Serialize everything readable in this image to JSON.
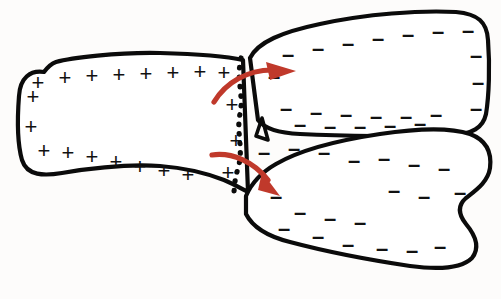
{
  "figure": {
    "background_color": "#fdfcfb",
    "outline_color": "#0b0b0b",
    "arrow_color": "#c0392b",
    "caption": ""
  },
  "cells": [
    {
      "id": "left-cell",
      "name": "positively-charged-cell",
      "charge_symbol": "+",
      "charge_sign": "positive",
      "charge_count": 20,
      "outline_path": "M 44 72 C 30 70 20 78 19 96 C 17 122 18 146 22 160 C 27 176 44 176 62 173 C 92 168 130 164 160 166 C 186 168 206 173 224 180 C 236 185 244 190 248 192 L 243 60 C 230 57 200 54 160 53 C 118 52 70 58 56 62 C 50 64 47 68 44 72 Z"
    },
    {
      "id": "top-right-cell",
      "name": "negatively-charged-cell-upper",
      "charge_symbol": "–",
      "charge_sign": "negative",
      "charge_count": 22,
      "outline_path": "M 250 58 C 258 42 282 32 320 24 C 366 14 420 10 456 12 C 478 14 487 22 488 40 C 490 66 489 96 486 114 C 483 128 472 134 452 135 C 410 137 340 136 300 134 C 278 133 264 128 258 120 L 250 58 Z"
    },
    {
      "id": "bottom-right-cell",
      "name": "negatively-charged-cell-lower",
      "charge_symbol": "–",
      "charge_sign": "negative",
      "charge_count": 20,
      "outline_path": "M 246 196 C 252 182 262 172 276 164 C 300 150 340 140 380 134 C 420 128 452 128 470 134 C 486 140 492 152 490 168 C 488 182 476 190 466 198 C 458 205 458 214 466 224 C 476 236 480 248 472 258 C 462 268 440 270 410 266 C 370 260 320 250 290 242 C 266 236 252 226 246 214 Z"
    }
  ],
  "junction": {
    "name": "membrane-junction",
    "style": "dotted",
    "path": "M 241 58 C 236 80 244 96 240 114 C 236 132 244 150 238 168 C 234 182 234 190 234 198"
  },
  "wedge": {
    "name": "cell-contact-wedge",
    "path": "M 262 118 L 268 140 L 256 136 Z"
  },
  "arrows": [
    {
      "id": "arrow-upper",
      "name": "transport-arrow-upper",
      "direction": "right-up",
      "color": "#c0392b",
      "body_path": "M 214 102 C 226 82 248 70 272 70",
      "head_points": "296 71 266 62 270 80"
    },
    {
      "id": "arrow-lower",
      "name": "transport-arrow-lower",
      "direction": "right-down",
      "color": "#c0392b",
      "body_path": "M 212 155 C 232 152 254 162 268 180",
      "head_points": "280 196 262 172 258 190"
    }
  ],
  "charge_marks": {
    "positive": [
      {
        "x": 33,
        "y": 96
      },
      {
        "x": 31,
        "y": 126
      },
      {
        "x": 38,
        "y": 82
      },
      {
        "x": 65,
        "y": 77
      },
      {
        "x": 92,
        "y": 75
      },
      {
        "x": 119,
        "y": 74
      },
      {
        "x": 146,
        "y": 73
      },
      {
        "x": 173,
        "y": 72
      },
      {
        "x": 200,
        "y": 71
      },
      {
        "x": 224,
        "y": 72
      },
      {
        "x": 232,
        "y": 104
      },
      {
        "x": 236,
        "y": 140
      },
      {
        "x": 228,
        "y": 172
      },
      {
        "x": 44,
        "y": 150
      },
      {
        "x": 68,
        "y": 152
      },
      {
        "x": 92,
        "y": 156
      },
      {
        "x": 116,
        "y": 161
      },
      {
        "x": 140,
        "y": 166
      },
      {
        "x": 164,
        "y": 170
      },
      {
        "x": 188,
        "y": 174
      }
    ],
    "negative_upper": [
      {
        "x": 288,
        "y": 54
      },
      {
        "x": 318,
        "y": 48
      },
      {
        "x": 348,
        "y": 43
      },
      {
        "x": 378,
        "y": 38
      },
      {
        "x": 408,
        "y": 34
      },
      {
        "x": 438,
        "y": 31
      },
      {
        "x": 468,
        "y": 30
      },
      {
        "x": 476,
        "y": 55
      },
      {
        "x": 478,
        "y": 82
      },
      {
        "x": 476,
        "y": 108
      },
      {
        "x": 274,
        "y": 76
      },
      {
        "x": 286,
        "y": 108
      },
      {
        "x": 316,
        "y": 112
      },
      {
        "x": 346,
        "y": 114
      },
      {
        "x": 376,
        "y": 116
      },
      {
        "x": 406,
        "y": 116
      },
      {
        "x": 436,
        "y": 114
      },
      {
        "x": 300,
        "y": 124
      },
      {
        "x": 330,
        "y": 126
      },
      {
        "x": 360,
        "y": 126
      },
      {
        "x": 390,
        "y": 125
      },
      {
        "x": 420,
        "y": 123
      }
    ],
    "negative_lower": [
      {
        "x": 264,
        "y": 152
      },
      {
        "x": 294,
        "y": 148
      },
      {
        "x": 324,
        "y": 152
      },
      {
        "x": 354,
        "y": 160
      },
      {
        "x": 384,
        "y": 158
      },
      {
        "x": 414,
        "y": 164
      },
      {
        "x": 444,
        "y": 168
      },
      {
        "x": 460,
        "y": 192
      },
      {
        "x": 424,
        "y": 196
      },
      {
        "x": 394,
        "y": 190
      },
      {
        "x": 276,
        "y": 196
      },
      {
        "x": 300,
        "y": 212
      },
      {
        "x": 330,
        "y": 218
      },
      {
        "x": 360,
        "y": 222
      },
      {
        "x": 284,
        "y": 228
      },
      {
        "x": 318,
        "y": 236
      },
      {
        "x": 348,
        "y": 244
      },
      {
        "x": 382,
        "y": 248
      },
      {
        "x": 412,
        "y": 250
      },
      {
        "x": 440,
        "y": 246
      }
    ]
  }
}
